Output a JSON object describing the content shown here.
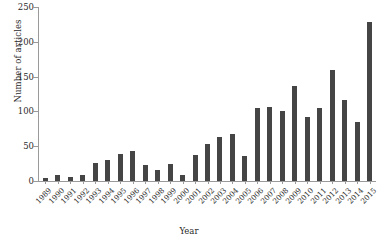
{
  "chart_data": {
    "type": "bar",
    "title": "",
    "xlabel": "Year",
    "ylabel": "Number of articles",
    "categories": [
      "1989",
      "1990",
      "1991",
      "1992",
      "1993",
      "1994",
      "1995",
      "1996",
      "1997",
      "1998",
      "1999",
      "2000",
      "2001",
      "2002",
      "2003",
      "2004",
      "2005",
      "2006",
      "2007",
      "2008",
      "2009",
      "2010",
      "2011",
      "2012",
      "2013",
      "2014",
      "2015"
    ],
    "values": [
      5,
      9,
      6,
      9,
      26,
      30,
      39,
      43,
      23,
      16,
      25,
      9,
      37,
      53,
      63,
      67,
      36,
      105,
      106,
      100,
      136,
      92,
      105,
      160,
      116,
      85,
      228
    ],
    "ylim": [
      0,
      250
    ],
    "yticks": [
      0,
      50,
      100,
      150,
      200,
      250
    ],
    "grid": false,
    "legend": false,
    "bar_color": "#454545",
    "axis_color": "#9a9a9a",
    "background": "#ffffff"
  },
  "axes": {
    "y_label": "Number of articles",
    "x_label": "Year",
    "y_tick_labels": [
      "0",
      "50",
      "100",
      "150",
      "200",
      "250"
    ]
  }
}
